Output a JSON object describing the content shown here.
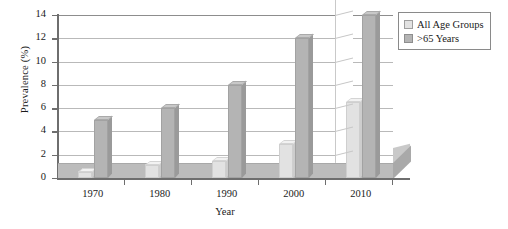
{
  "chart_data": {
    "type": "bar",
    "title": "",
    "xlabel": "Year",
    "ylabel": "Prevalence (%)",
    "categories": [
      "1970",
      "1980",
      "1990",
      "2000",
      "2010"
    ],
    "series": [
      {
        "name": "All Age Groups",
        "values": [
          0.5,
          1.1,
          1.5,
          2.9,
          6.5
        ],
        "color": "#e2e2e2"
      },
      {
        "name": ">65 Years",
        "values": [
          5.0,
          6.0,
          8.0,
          12.0,
          14.0
        ],
        "color": "#b4b4b4"
      }
    ],
    "ylim": [
      0,
      14
    ],
    "yticks": [
      "0",
      "2",
      "4",
      "6",
      "8",
      "10",
      "12",
      "14"
    ],
    "ytick_values": [
      0,
      2,
      4,
      6,
      8,
      10,
      12,
      14
    ],
    "grid": true,
    "legend_position": "top-right",
    "style": "3d-column"
  },
  "legend": {
    "entries": [
      {
        "label": "All Age Groups"
      },
      {
        "label": ">65 Years"
      }
    ]
  }
}
